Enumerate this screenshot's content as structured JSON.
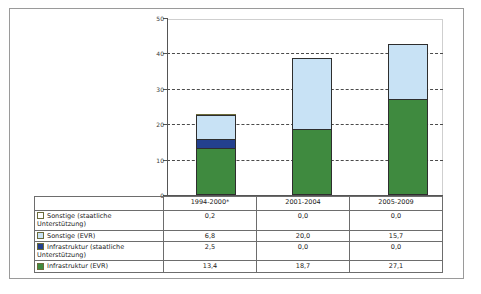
{
  "chart_data": {
    "type": "bar",
    "subtype": "stacked-column",
    "categories": [
      "1994-2000*",
      "2001-2004",
      "2005-2009"
    ],
    "series": [
      {
        "name": "Sonstige (staatliche Unterstützung)",
        "values": [
          0.2,
          0.0,
          0.0
        ],
        "color": "#ffffff",
        "border": "#6b6b3a",
        "display": [
          "0,2",
          "0,0",
          "0,0"
        ]
      },
      {
        "name": "Sonstige (EVR)",
        "values": [
          6.8,
          20.0,
          15.7
        ],
        "color": "#c8e2f5",
        "border": "#2e2e2e",
        "display": [
          "6,8",
          "20,0",
          "15,7"
        ]
      },
      {
        "name": "Infrastruktur (staatliche Unterstützung)",
        "values": [
          2.5,
          0.0,
          0.0
        ],
        "color": "#23408e",
        "border": "#2e2e2e",
        "display": [
          "2,5",
          "0,0",
          "0,0"
        ]
      },
      {
        "name": "Infrastruktur (EVR)",
        "values": [
          13.4,
          18.7,
          27.1
        ],
        "color": "#3f8a3f",
        "border": "#2e2e2e",
        "display": [
          "13,4",
          "18,7",
          "27,1"
        ]
      }
    ],
    "stack_order_bottom_to_top": [
      "Infrastruktur (EVR)",
      "Infrastruktur (staatliche Unterstützung)",
      "Sonstige (EVR)",
      "Sonstige (staatliche Unterstützung)"
    ],
    "totals": [
      22.9,
      38.7,
      42.8
    ],
    "title": "",
    "xlabel": "",
    "ylabel": "",
    "ylim": [
      0,
      50
    ],
    "yticks": [
      "0",
      "10",
      "20",
      "30",
      "40",
      "50"
    ],
    "ytick_values": [
      0,
      10,
      20,
      30,
      40,
      50
    ],
    "grid": "horizontal-dashed",
    "legend_position": "data-table-left-column"
  },
  "table": {
    "category_row": [
      "",
      "1994-2000*",
      "2001-2004",
      "2005-2009"
    ],
    "rows": [
      {
        "legend": "Sonstige (staatliche Unterstützung)",
        "swatch_fill": "#ffffff",
        "swatch_border": "#6b6b3a",
        "values": [
          "0,2",
          "0,0",
          "0,0"
        ]
      },
      {
        "legend": "Sonstige (EVR)",
        "swatch_fill": "#c8e2f5",
        "swatch_border": "#6b6b3a",
        "values": [
          "6,8",
          "20,0",
          "15,7"
        ]
      },
      {
        "legend": "Infrastruktur (staatliche Unterstützung)",
        "swatch_fill": "#23408e",
        "swatch_border": "#6b6b3a",
        "values": [
          "2,5",
          "0,0",
          "0,0"
        ]
      },
      {
        "legend": "Infrastruktur (EVR)",
        "swatch_fill": "#3f8a3f",
        "swatch_border": "#6b6b3a",
        "values": [
          "13,4",
          "18,7",
          "27,1"
        ]
      }
    ]
  },
  "colors": {
    "green": "#3f8a3f",
    "dark_blue": "#23408e",
    "light_blue": "#c8e2f5",
    "white": "#ffffff",
    "axis": "#555555",
    "grid": "#4a4a4a",
    "frame": "#9a9a9a",
    "table_border": "#6d6d6d"
  }
}
